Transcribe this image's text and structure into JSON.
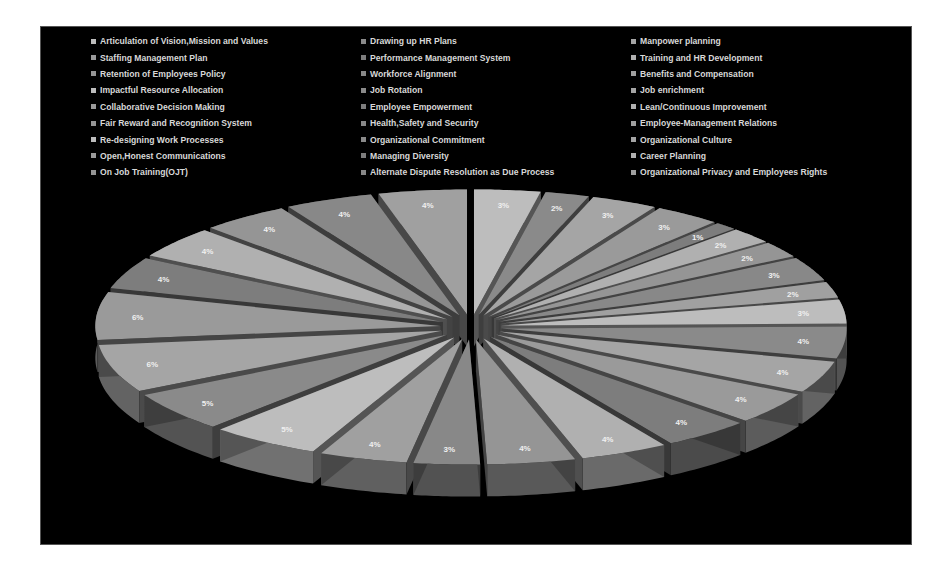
{
  "chart_data": {
    "type": "pie",
    "style": "3d-exploded",
    "title": "",
    "legend_position": "top",
    "categories": [
      "Articulation of Vision,Mission and Values",
      "Drawing up HR Plans",
      "Manpower planning",
      "Staffing Management Plan",
      "Performance Management System",
      "Training and HR Development",
      "Retention of Employees Policy",
      "Workforce Alignment",
      "Benefits and Compensation",
      "Impactful Resource Allocation",
      "Job Rotation",
      "Job enrichment",
      "Collaborative Decision Making",
      "Employee Empowerment",
      "Lean/Continuous Improvement",
      "Fair Reward and Recognition System",
      "Health,Safety and Security",
      "Employee-Management Relations",
      "Re-designing Work Processes",
      "Organizational Commitment",
      "Organizational Culture",
      "Open,Honest Communications",
      "Managing Diversity",
      "Career Planning",
      "On Job Training(OJT)",
      "Alternate Dispute Resolution as Due Process",
      "Organizational Privacy and Employees Rights"
    ],
    "values": [
      3,
      2,
      3,
      3,
      1,
      2,
      2,
      3,
      2,
      3,
      4,
      4,
      4,
      4,
      4,
      4,
      3,
      4,
      5,
      5,
      6,
      6,
      4,
      4,
      4,
      4,
      4
    ],
    "value_labels": [
      "3%",
      "2%",
      "3%",
      "3%",
      "1%",
      "2%",
      "2%",
      "3%",
      "2%",
      "3%",
      "4%",
      "4%",
      "4%",
      "4%",
      "4%",
      "4%",
      "3%",
      "4%",
      "5%",
      "5%",
      "6%",
      "6%",
      "4%",
      "4%",
      "4%",
      "4%",
      "4%"
    ],
    "unit": "%"
  },
  "legend": {
    "columns": [
      [
        "Articulation of Vision,Mission and Values",
        "Staffing Management Plan",
        "Retention of Employees Policy",
        "Impactful Resource Allocation",
        "Collaborative Decision Making",
        "Fair Reward and Recognition System",
        "Re-designing Work Processes",
        "Open,Honest Communications",
        "On Job Training(OJT)"
      ],
      [
        "Drawing up HR Plans",
        "Performance Management System",
        "Workforce Alignment",
        "Job Rotation",
        "Employee Empowerment",
        "Health,Safety and Security",
        "Organizational Commitment",
        "Managing Diversity",
        "Alternate Dispute Resolution as Due Process"
      ],
      [
        "Manpower planning",
        "Training and HR Development",
        "Benefits and Compensation",
        "Job enrichment",
        "Lean/Continuous Improvement",
        "Employee-Management Relations",
        "Organizational Culture",
        "Career Planning",
        "Organizational Privacy and Employees Rights"
      ]
    ]
  },
  "colors": {
    "background": "#000000",
    "text": "#d8d8d8"
  }
}
